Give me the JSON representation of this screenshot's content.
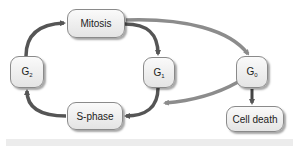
{
  "diagram": {
    "colors": {
      "arrow_dark": "#555555",
      "arrow_light": "#8c8c8c",
      "node_border": "#8a8a8a",
      "node_fill_top": "#fafafa",
      "node_fill_bottom": "#e4e4e4"
    },
    "nodes": {
      "mitosis": {
        "label": "Mitosis"
      },
      "g2": {
        "main": "G",
        "sub": "2"
      },
      "g1": {
        "main": "G",
        "sub": "1"
      },
      "g0": {
        "main": "G",
        "sub": "0"
      },
      "s_phase": {
        "label": "S-phase"
      },
      "cell_death": {
        "label": "Cell death"
      }
    },
    "edges": [
      {
        "from": "G2",
        "to": "Mitosis"
      },
      {
        "from": "Mitosis",
        "to": "G1"
      },
      {
        "from": "Mitosis",
        "to": "G0"
      },
      {
        "from": "G1",
        "to": "S-phase"
      },
      {
        "from": "G0",
        "to": "S-phase"
      },
      {
        "from": "S-phase",
        "to": "G2"
      },
      {
        "from": "G0",
        "to": "Cell death"
      }
    ]
  }
}
